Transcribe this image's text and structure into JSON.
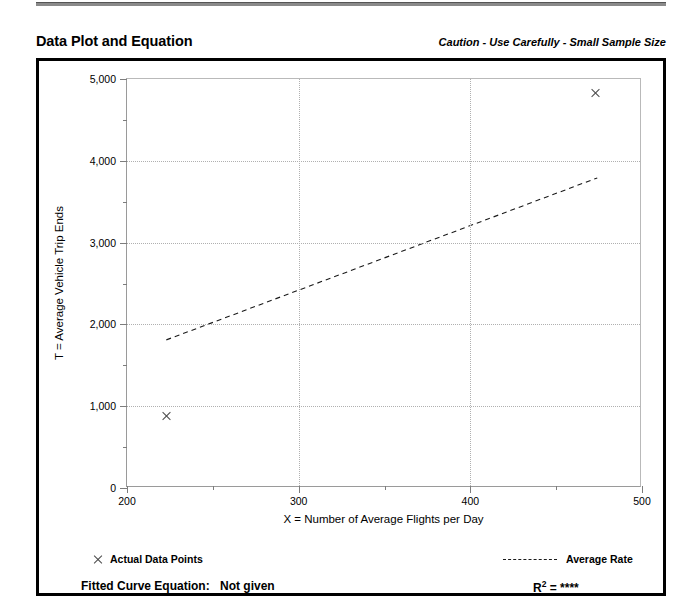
{
  "header": {
    "title": "Data Plot and Equation",
    "caution": "Caution - Use Carefully - Small Sample Size"
  },
  "footer": {
    "equation_label": "Fitted Curve Equation:",
    "equation_value": "Not given",
    "r2_prefix": "R",
    "r2_exponent": "2",
    "r2_value": "= ****"
  },
  "legend": {
    "points_label": "Actual Data Points",
    "rate_label": "Average Rate",
    "point_marker_icon": "x-marker-icon",
    "rate_line_icon": "dashed-line-icon"
  },
  "chart_data": {
    "type": "scatter",
    "title": "Data Plot and Equation",
    "xlabel": "X = Number of Average Flights per Day",
    "ylabel": "T = Average Vehicle Trip Ends",
    "xlim": [
      200,
      500
    ],
    "ylim": [
      0,
      5000
    ],
    "xticks": [
      200,
      300,
      400,
      500
    ],
    "xtick_labels": [
      "200",
      "300",
      "400",
      "500"
    ],
    "xminor_step": 50,
    "yticks": [
      0,
      1000,
      2000,
      3000,
      4000,
      5000
    ],
    "ytick_labels": [
      "0",
      "1,000",
      "2,000",
      "3,000",
      "4,000",
      "5,000"
    ],
    "yminor_step": 500,
    "grid": true,
    "grid_style": "dotted",
    "legend_position": "below-plot",
    "series": [
      {
        "name": "Actual Data Points",
        "type": "scatter",
        "marker": "x",
        "color": "#4a4a4a",
        "points": [
          {
            "x": 223,
            "y": 875
          },
          {
            "x": 473,
            "y": 4825
          }
        ]
      },
      {
        "name": "Average Rate",
        "type": "line",
        "style": "dashed",
        "color": "#1a1a1a",
        "points": [
          {
            "x": 223,
            "y": 1795
          },
          {
            "x": 475,
            "y": 3785
          }
        ]
      }
    ],
    "annotations": {
      "r_squared": "****",
      "fitted_curve_equation": "Not given",
      "caution": "Caution - Use Carefully - Small Sample Size"
    }
  },
  "colors": {
    "frame": "#000000",
    "grid": "#b0b0b0",
    "axis": "#7d7d7d",
    "marker": "#4a4a4a",
    "trendline": "#1a1a1a"
  }
}
